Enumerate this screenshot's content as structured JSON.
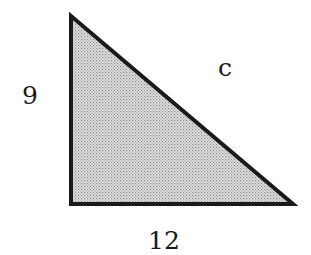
{
  "diagram": {
    "type": "right-triangle",
    "fill_color": "#c8c8c8",
    "stroke_color": "#1a1a1a",
    "vertices": {
      "top": [
        71,
        16
      ],
      "right_angle": [
        71,
        204
      ],
      "bottom_right": [
        293,
        204
      ]
    },
    "labels": {
      "left_leg": "9",
      "hypotenuse": "c",
      "bottom_leg": "12"
    }
  }
}
